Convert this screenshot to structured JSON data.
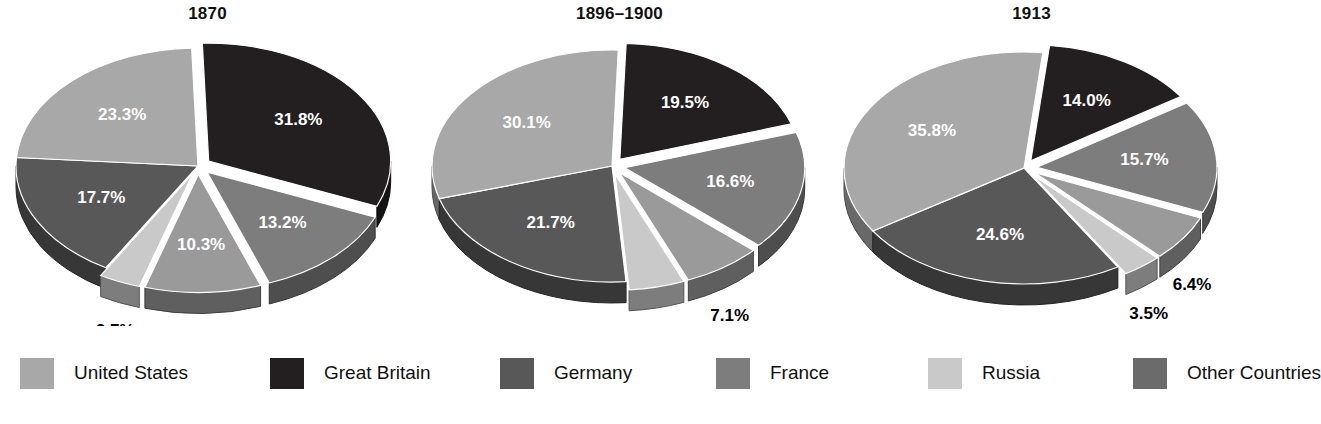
{
  "chart_data": [
    {
      "type": "pie",
      "title": "1870",
      "categories": [
        "Great Britain",
        "France",
        "Russia",
        "Other Countries",
        "Germany",
        "United States"
      ],
      "values": [
        31.8,
        13.2,
        10.3,
        3.7,
        17.7,
        23.3
      ],
      "labels": [
        "31.8%",
        "13.2%",
        "10.3%",
        "3.7%",
        "17.7%",
        "23.3%"
      ],
      "label_colors": [
        "#ffffff",
        "#ffffff",
        "#ffffff",
        "#000000",
        "#ffffff",
        "#ffffff"
      ],
      "slice_colors": [
        "#231f20",
        "#7d7d7d",
        "#9a9a9a",
        "#c9c9c9",
        "#585858",
        "#a8a8a8"
      ],
      "exploded": [
        true,
        true,
        true,
        true,
        false,
        false
      ]
    },
    {
      "type": "pie",
      "title": "1896–1900",
      "categories": [
        "Great Britain",
        "France",
        "Russia",
        "Other Countries",
        "Germany",
        "United States"
      ],
      "values": [
        19.5,
        16.6,
        7.1,
        5.0,
        21.7,
        30.1
      ],
      "labels": [
        "19.5%",
        "16.6%",
        "7.1%",
        "5.0%",
        "21.7%",
        "30.1%"
      ],
      "label_colors": [
        "#ffffff",
        "#ffffff",
        "#000000",
        "#000000",
        "#ffffff",
        "#ffffff"
      ],
      "slice_colors": [
        "#231f20",
        "#7d7d7d",
        "#9a9a9a",
        "#c9c9c9",
        "#585858",
        "#a8a8a8"
      ],
      "exploded": [
        true,
        true,
        true,
        true,
        false,
        false
      ]
    },
    {
      "type": "pie",
      "title": "1913",
      "categories": [
        "Great Britain",
        "France",
        "Russia",
        "Other Countries",
        "Germany",
        "United States"
      ],
      "values": [
        14.0,
        15.7,
        6.4,
        3.5,
        24.6,
        35.8
      ],
      "labels": [
        "14.0%",
        "15.7%",
        "6.4%",
        "3.5%",
        "24.6%",
        "35.8%"
      ],
      "label_colors": [
        "#ffffff",
        "#ffffff",
        "#000000",
        "#000000",
        "#ffffff",
        "#ffffff"
      ],
      "slice_colors": [
        "#231f20",
        "#7d7d7d",
        "#9a9a9a",
        "#c9c9c9",
        "#585858",
        "#a8a8a8"
      ],
      "exploded": [
        true,
        true,
        true,
        true,
        false,
        false
      ]
    }
  ],
  "legend": {
    "position": "bottom",
    "items": [
      {
        "label": "United States",
        "color": "#a8a8a8"
      },
      {
        "label": "Great Britain",
        "color": "#231f20"
      },
      {
        "label": "Germany",
        "color": "#585858"
      },
      {
        "label": "France",
        "color": "#7d7d7d"
      },
      {
        "label": "Russia",
        "color": "#c9c9c9"
      },
      {
        "label": "Other Countries",
        "color": "#6b6b6b"
      }
    ]
  },
  "panel_titles": [
    "1870",
    "1896–1900",
    "1913"
  ]
}
